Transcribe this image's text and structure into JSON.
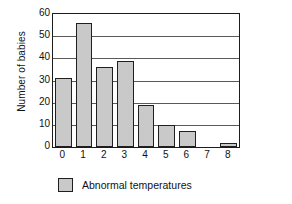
{
  "chart_data": {
    "type": "bar",
    "title": "",
    "xlabel": "",
    "ylabel": "Number of babies",
    "categories": [
      "0",
      "1",
      "2",
      "3",
      "4",
      "5",
      "6",
      "7",
      "8"
    ],
    "values": [
      31,
      56,
      36,
      39,
      19,
      10,
      7,
      0,
      2
    ],
    "series": [
      {
        "name": "Abnormal temperatures",
        "values": [
          31,
          56,
          36,
          39,
          19,
          10,
          7,
          0,
          2
        ],
        "color": "#c9c9c9"
      }
    ],
    "ylim": [
      0,
      60
    ],
    "y_ticks": [
      "0",
      "10",
      "20",
      "30",
      "40",
      "50",
      "60"
    ],
    "y_tick_values": [
      0,
      10,
      20,
      30,
      40,
      50,
      60
    ],
    "grid": "horizontal",
    "legend_position": "bottom-left",
    "legend": [
      {
        "label": "Abnormal temperatures",
        "color": "#c9c9c9"
      }
    ],
    "bar_edge_color": "#1f1f1f",
    "frame_color": "#1c1c1c"
  }
}
